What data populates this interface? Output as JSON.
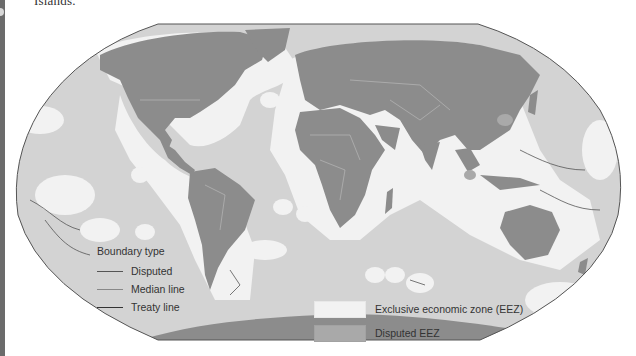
{
  "caption": {
    "text": "Islands."
  },
  "map": {
    "projection": "robinson-like world map",
    "colors": {
      "ocean": "#d3d3d3",
      "land": "#8c8c8c",
      "eez": "#f2f2f2",
      "disputed_eez": "#a9a9a9",
      "outline": "#555555",
      "boundary_disputed": "#555555",
      "boundary_median": "#8a8a8a",
      "boundary_treaty": "#333333"
    }
  },
  "legend_boundary": {
    "title": "Boundary type",
    "items": [
      {
        "label": "Disputed",
        "type": "disputed"
      },
      {
        "label": "Median line",
        "type": "median"
      },
      {
        "label": "Treaty line",
        "type": "treaty"
      }
    ]
  },
  "legend_zones": {
    "items": [
      {
        "label": "Exclusive economic zone (EEZ)",
        "color": "#f2f2f2"
      },
      {
        "label": "Disputed EEZ",
        "color": "#a9a9a9"
      }
    ]
  }
}
